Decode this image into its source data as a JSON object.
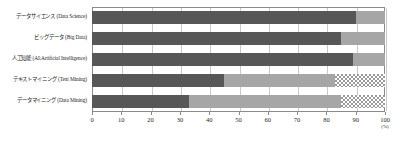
{
  "chart_data": {
    "type": "bar",
    "orientation": "horizontal",
    "stacked": true,
    "title": "",
    "xlabel": "(%)",
    "ylabel": "",
    "xlim": [
      0,
      100
    ],
    "xticks": [
      0,
      10,
      20,
      30,
      40,
      50,
      60,
      70,
      80,
      90,
      100
    ],
    "xtick_labels": [
      "0",
      "10",
      "20",
      "30",
      "40",
      "50",
      "60",
      "70",
      "80",
      "90",
      "100"
    ],
    "unit": "(%)",
    "grid": true,
    "legend": "none",
    "categories": [
      "データサイエンス (Data Science)",
      "ビッグデータ (Big Data)",
      "人工知能 (AI:Artificial Intelligence)",
      "テキストマイニング (Text Mining)",
      "データマイニング (Data Mining)"
    ],
    "series": [
      {
        "name": "segment-dark",
        "values": [
          90,
          85,
          89,
          45,
          33
        ]
      },
      {
        "name": "segment-mid",
        "values": [
          10,
          15,
          11,
          38,
          52
        ]
      },
      {
        "name": "segment-hatch",
        "values": [
          0,
          0,
          0,
          17,
          15
        ]
      }
    ],
    "colors": {
      "segment_dark": "#575757",
      "segment_mid": "#a6a6a6",
      "segment_hatch": "#9a9a9a",
      "axis": "#8a8a8a",
      "grid": "#c9c9c9",
      "text": "#1f1f1f"
    }
  }
}
